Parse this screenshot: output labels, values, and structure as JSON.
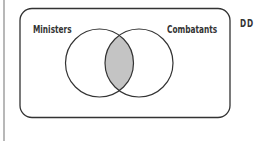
{
  "diagram": {
    "type": "venn",
    "universe_label": "DD",
    "sets": [
      {
        "label": "Ministers",
        "cx": 99.5,
        "cy": 63,
        "r": 34
      },
      {
        "label": "Combatants",
        "cx": 139,
        "cy": 63,
        "r": 34
      }
    ],
    "shaded_region": "intersection",
    "colors": {
      "stroke": "#333333",
      "shade": "#c4c4c4",
      "background": "#ffffff"
    }
  }
}
